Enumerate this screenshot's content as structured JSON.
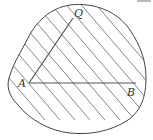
{
  "figure": {
    "points": {
      "A": {
        "label": "A",
        "x": 29,
        "y": 83
      },
      "B": {
        "label": "B",
        "x": 136,
        "y": 83
      },
      "Q": {
        "label": "Q",
        "x": 74,
        "y": 17
      }
    },
    "segments": [
      {
        "from": "A",
        "to": "B"
      },
      {
        "from": "A",
        "to": "Q"
      }
    ],
    "hatching": {
      "direction": "down-right",
      "count": 11
    },
    "colors": {
      "stroke": "#444444",
      "hatch": "#666666",
      "background": "#ffffff"
    }
  }
}
